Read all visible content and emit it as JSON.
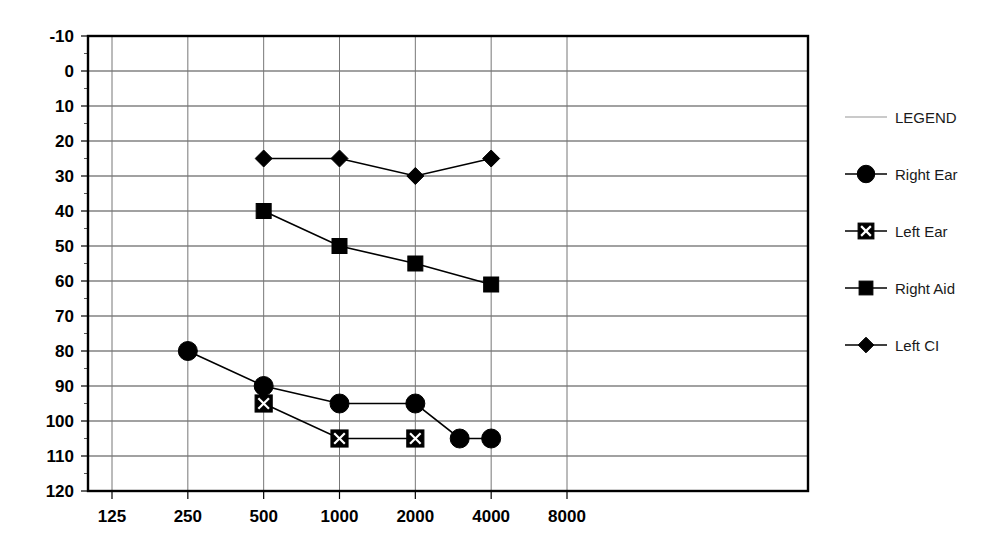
{
  "chart_data": {
    "type": "line",
    "title": "",
    "subtitle": "",
    "xlabel": "",
    "ylabel": "",
    "x_tick_labels": [
      "125",
      "250",
      "500",
      "1000",
      "2000",
      "4000",
      "8000"
    ],
    "x_tick_values": [
      125,
      250,
      500,
      1000,
      2000,
      4000,
      8000
    ],
    "y_tick_labels": [
      "-10",
      "0",
      "10",
      "20",
      "30",
      "40",
      "50",
      "60",
      "70",
      "80",
      "90",
      "100",
      "110",
      "120"
    ],
    "y_tick_values": [
      -10,
      0,
      10,
      20,
      30,
      40,
      50,
      60,
      70,
      80,
      90,
      100,
      110,
      120
    ],
    "ylim": [
      -10,
      120
    ],
    "y_inverted": true,
    "x_scale": "log2",
    "grid": "both",
    "legend_position": "right",
    "series": [
      {
        "name": "Right Ear",
        "marker": "filled-circle",
        "color": "#000000",
        "points": [
          {
            "x": 250,
            "y": 80
          },
          {
            "x": 500,
            "y": 90
          },
          {
            "x": 1000,
            "y": 95
          },
          {
            "x": 2000,
            "y": 95
          },
          {
            "x": 3000,
            "y": 105
          },
          {
            "x": 4000,
            "y": 105
          }
        ]
      },
      {
        "name": "Left Ear",
        "marker": "square-with-x",
        "color": "#000000",
        "points": [
          {
            "x": 500,
            "y": 95
          },
          {
            "x": 1000,
            "y": 105
          },
          {
            "x": 2000,
            "y": 105
          }
        ]
      },
      {
        "name": "Right Aid",
        "marker": "filled-square",
        "color": "#000000",
        "points": [
          {
            "x": 500,
            "y": 40
          },
          {
            "x": 1000,
            "y": 50
          },
          {
            "x": 2000,
            "y": 55
          },
          {
            "x": 4000,
            "y": 61
          }
        ]
      },
      {
        "name": "Left CI",
        "marker": "filled-diamond",
        "color": "#000000",
        "points": [
          {
            "x": 500,
            "y": 25
          },
          {
            "x": 1000,
            "y": 25
          },
          {
            "x": 2000,
            "y": 30
          },
          {
            "x": 4000,
            "y": 25
          }
        ]
      }
    ]
  },
  "legend": {
    "title": "LEGEND",
    "entries": [
      {
        "label": "Right Ear",
        "marker": "filled-circle"
      },
      {
        "label": "Left Ear",
        "marker": "square-with-x"
      },
      {
        "label": "Right Aid",
        "marker": "filled-square"
      },
      {
        "label": "Left CI",
        "marker": "filled-diamond"
      }
    ]
  },
  "axes": {
    "y_labels": [
      "-10",
      "0",
      "10",
      "20",
      "30",
      "40",
      "50",
      "60",
      "70",
      "80",
      "90",
      "100",
      "110",
      "120"
    ],
    "x_labels": [
      "125",
      "250",
      "500",
      "1000",
      "2000",
      "4000",
      "8000"
    ]
  },
  "colors": {
    "ink": "#000000",
    "grid_major": "#444444",
    "grid_minor": "#777777",
    "legend_rule": "#b8b8b8",
    "background": "#ffffff"
  }
}
